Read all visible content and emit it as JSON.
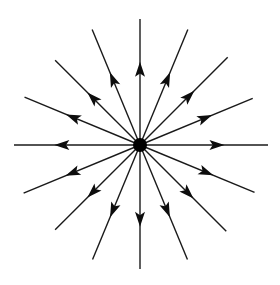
{
  "figure": {
    "kind": "vector-field-diagram",
    "pattern": "radial source (positive divergence)",
    "width": 280,
    "height": 285,
    "background_color": "#ffffff",
    "line_color": "#1a1a1a",
    "arrow_color": "#0d0d0d",
    "center_color": "#000000"
  },
  "chart_data": {
    "type": "scatter",
    "subtitle": "",
    "xlabel": "",
    "ylabel": "",
    "grid": false,
    "legend": null,
    "axis_visible": false,
    "xlim": [
      0,
      280
    ],
    "ylim": [
      0,
      285
    ],
    "center": {
      "x": 140,
      "y": 145,
      "radius": 7
    },
    "ray_count": 16,
    "angle_step_degrees": 22.5,
    "arrow_direction": "outward",
    "arrow_position_fraction": 0.64,
    "arrow_length": 15,
    "arrow_half_width": 5,
    "line_width": 1.4,
    "rays": [
      {
        "label": "E",
        "angle_deg": 0,
        "length": 128,
        "arrow_fraction": 0.66
      },
      {
        "label": "ENE",
        "angle_deg": 22.5,
        "length": 122,
        "arrow_fraction": 0.64
      },
      {
        "label": "NE",
        "angle_deg": 45,
        "length": 124,
        "arrow_fraction": 0.62
      },
      {
        "label": "NNE",
        "angle_deg": 67.5,
        "length": 125,
        "arrow_fraction": 0.63
      },
      {
        "label": "N",
        "angle_deg": 90,
        "length": 126,
        "arrow_fraction": 0.66
      },
      {
        "label": "NNW",
        "angle_deg": 112.5,
        "length": 125,
        "arrow_fraction": 0.63
      },
      {
        "label": "NW",
        "angle_deg": 135,
        "length": 120,
        "arrow_fraction": 0.62
      },
      {
        "label": "WNW",
        "angle_deg": 157.5,
        "length": 125,
        "arrow_fraction": 0.64
      },
      {
        "label": "W",
        "angle_deg": 180,
        "length": 126,
        "arrow_fraction": 0.68
      },
      {
        "label": "WSW",
        "angle_deg": 202.5,
        "length": 126,
        "arrow_fraction": 0.64
      },
      {
        "label": "SW",
        "angle_deg": 225,
        "length": 120,
        "arrow_fraction": 0.62
      },
      {
        "label": "SSW",
        "angle_deg": 247.5,
        "length": 124,
        "arrow_fraction": 0.63
      },
      {
        "label": "S",
        "angle_deg": 270,
        "length": 124,
        "arrow_fraction": 0.66
      },
      {
        "label": "SSE",
        "angle_deg": 292.5,
        "length": 124,
        "arrow_fraction": 0.63
      },
      {
        "label": "SE",
        "angle_deg": 315,
        "length": 122,
        "arrow_fraction": 0.62
      },
      {
        "label": "ESE",
        "angle_deg": 337.5,
        "length": 124,
        "arrow_fraction": 0.64
      }
    ]
  }
}
